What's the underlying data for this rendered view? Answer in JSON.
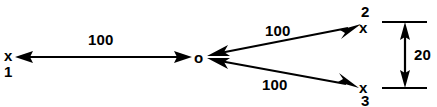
{
  "diagram": {
    "background_color": "#ffffff",
    "stroke_color": "#000000",
    "center_node": {
      "symbol": "o",
      "name": "origin-node"
    },
    "nodes": [
      {
        "symbol": "x",
        "index": "1",
        "position": "left"
      },
      {
        "symbol": "x",
        "index": "2",
        "position": "top-right"
      },
      {
        "symbol": "x",
        "index": "3",
        "position": "bottom-right"
      }
    ],
    "edges": [
      {
        "label": "100",
        "from": "x1",
        "to": "o"
      },
      {
        "label": "100",
        "from": "o",
        "to": "x2"
      },
      {
        "label": "100",
        "from": "o",
        "to": "x3"
      }
    ],
    "dimension": {
      "label": "20",
      "orientation": "vertical",
      "between": [
        "x2",
        "x3"
      ]
    }
  }
}
